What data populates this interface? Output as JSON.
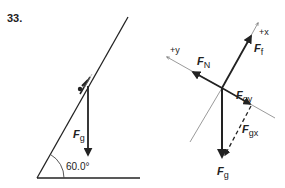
{
  "problem": {
    "number": "33."
  },
  "left_diagram": {
    "incline_angle": "60.0°",
    "force_label": "F",
    "force_sub": "g"
  },
  "right_diagram": {
    "axes": {
      "x_label": "+x",
      "y_label": "+y"
    },
    "forces": [
      {
        "name": "F",
        "sub": "f",
        "style": "solid"
      },
      {
        "name": "F",
        "sub": "N",
        "style": "solid"
      },
      {
        "name": "F",
        "sub": "gy",
        "style": "solid"
      },
      {
        "name": "F",
        "sub": "gx",
        "style": "dashed"
      },
      {
        "name": "F",
        "sub": "g",
        "style": "solid"
      }
    ]
  },
  "colors": {
    "ink": "#222222",
    "axis": "#555555",
    "background": "#ffffff"
  }
}
